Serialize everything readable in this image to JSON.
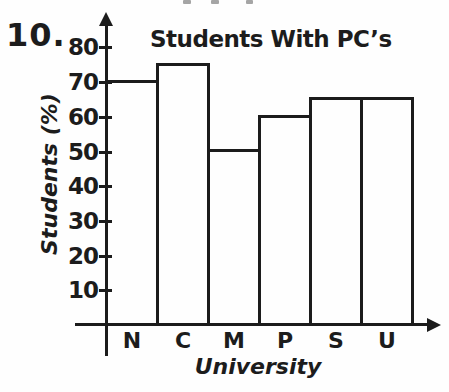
{
  "page": {
    "item_number": "10.",
    "background_color": "#fefefe",
    "ink_color": "#1c1c1c",
    "artifact_color": "#8f8f8f"
  },
  "chart_data": {
    "type": "bar",
    "title": "Students With PC’s",
    "xlabel": "University",
    "ylabel": "Students (%)",
    "categories": [
      "N",
      "C",
      "M",
      "P",
      "S",
      "U"
    ],
    "values": [
      70,
      75,
      50,
      60,
      65,
      65
    ],
    "yticks": [
      10,
      20,
      30,
      40,
      50,
      60,
      70,
      80
    ],
    "ylim": [
      0,
      85
    ],
    "grid": false,
    "legend": "none",
    "bar_fill": "unfilled-outline",
    "bars_adjacent": true
  }
}
